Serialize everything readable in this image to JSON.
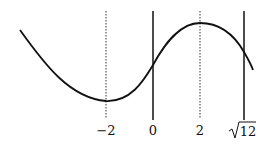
{
  "diagram": {
    "labels": {
      "neg2": "−2",
      "zero": "0",
      "two": "2",
      "sqrt12_num": "12"
    },
    "lines": [
      {
        "x_value": "-2",
        "style": "dotted"
      },
      {
        "x_value": "0",
        "style": "solid"
      },
      {
        "x_value": "2",
        "style": "dotted"
      },
      {
        "x_value": "sqrt(12)",
        "style": "solid"
      }
    ],
    "colors": {
      "stroke": "#111111",
      "background": "#ffffff"
    }
  }
}
